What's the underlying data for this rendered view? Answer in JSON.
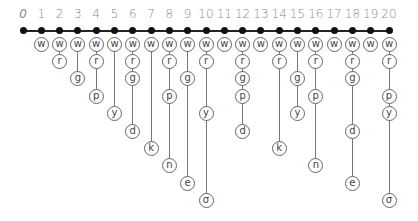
{
  "diagram": {
    "number_line": {
      "start": 0,
      "end": 20,
      "labels": [
        "0",
        "1",
        "2",
        "3",
        "4",
        "5",
        "6",
        "7",
        "8",
        "9",
        "10",
        "11",
        "12",
        "13",
        "14",
        "15",
        "16",
        "17",
        "18",
        "19",
        "20"
      ]
    },
    "row_order": [
      "w",
      "r",
      "g",
      "p",
      "y",
      "d",
      "k",
      "n",
      "e",
      "σ"
    ],
    "columns": [
      {
        "n": 0,
        "letters": []
      },
      {
        "n": 1,
        "letters": [
          "w"
        ]
      },
      {
        "n": 2,
        "letters": [
          "w",
          "r"
        ]
      },
      {
        "n": 3,
        "letters": [
          "w",
          "g"
        ]
      },
      {
        "n": 4,
        "letters": [
          "w",
          "r",
          "p"
        ]
      },
      {
        "n": 5,
        "letters": [
          "w",
          "y"
        ]
      },
      {
        "n": 6,
        "letters": [
          "w",
          "r",
          "g",
          "d"
        ]
      },
      {
        "n": 7,
        "letters": [
          "w",
          "k"
        ]
      },
      {
        "n": 8,
        "letters": [
          "w",
          "r",
          "p",
          "n"
        ]
      },
      {
        "n": 9,
        "letters": [
          "w",
          "g",
          "e"
        ]
      },
      {
        "n": 10,
        "letters": [
          "w",
          "r",
          "y",
          "σ"
        ]
      },
      {
        "n": 11,
        "letters": [
          "w"
        ]
      },
      {
        "n": 12,
        "letters": [
          "w",
          "r",
          "g",
          "p",
          "d"
        ]
      },
      {
        "n": 13,
        "letters": [
          "w"
        ]
      },
      {
        "n": 14,
        "letters": [
          "w",
          "r",
          "k"
        ]
      },
      {
        "n": 15,
        "letters": [
          "w",
          "g",
          "y"
        ]
      },
      {
        "n": 16,
        "letters": [
          "w",
          "r",
          "p",
          "n"
        ]
      },
      {
        "n": 17,
        "letters": [
          "w"
        ]
      },
      {
        "n": 18,
        "letters": [
          "w",
          "r",
          "g",
          "d",
          "e"
        ]
      },
      {
        "n": 19,
        "letters": [
          "w"
        ]
      },
      {
        "n": 20,
        "letters": [
          "w",
          "r",
          "p",
          "y",
          "σ"
        ]
      }
    ]
  }
}
